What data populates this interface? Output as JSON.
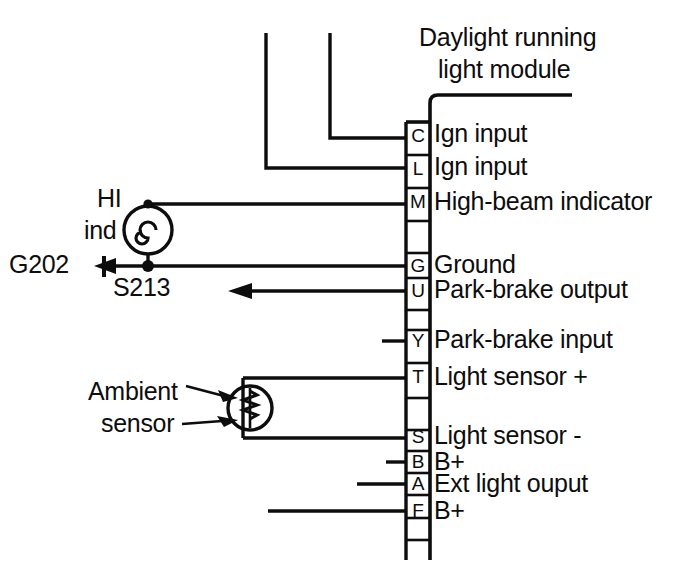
{
  "diagram": {
    "kind": "automotive-wiring-diagram",
    "module_title_line1": "Daylight running",
    "module_title_line2": "light module",
    "ink_color": "#0d0d0d",
    "background_color": "#ffffff"
  },
  "pins": [
    {
      "letter": "C",
      "description": "Ign input",
      "wire": "up-long"
    },
    {
      "letter": "L",
      "description": "Ign input",
      "wire": "up-longer"
    },
    {
      "letter": "M",
      "description": "High-beam indicator",
      "wire": "to-hi-ind-lamp"
    },
    {
      "letter": "G",
      "description": "Ground",
      "wire": "to-s213-ground"
    },
    {
      "letter": "U",
      "description": "Park-brake output",
      "wire": "arrow-left"
    },
    {
      "letter": "Y",
      "description": "Park-brake input",
      "wire": "stub-short"
    },
    {
      "letter": "T",
      "description": "Light sensor +",
      "wire": "to-ambient-sensor-top"
    },
    {
      "letter": "S",
      "description": "Light sensor -",
      "wire": "to-ambient-sensor-bottom"
    },
    {
      "letter": "B",
      "description": "B+",
      "wire": "stub-short"
    },
    {
      "letter": "A",
      "description": "Ext light ouput",
      "wire": "stub-medium"
    },
    {
      "letter": "F",
      "description": "B+",
      "wire": "stub-long"
    }
  ],
  "components": {
    "high_beam_indicator": {
      "label_line1": "HI",
      "label_line2": "ind",
      "symbol": "lamp-indicator"
    },
    "ambient_sensor": {
      "label_line1": "Ambient",
      "label_line2": "sensor",
      "symbol": "photoresistor"
    }
  },
  "nodes": {
    "ground": "G202",
    "splice": "S213"
  }
}
